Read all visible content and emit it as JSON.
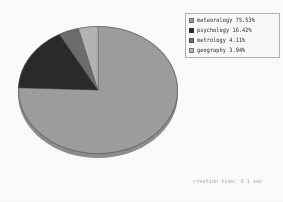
{
  "chart_data": {
    "type": "pie",
    "title": "",
    "subtitle": "",
    "xlabel": "",
    "ylabel": "",
    "grid": false,
    "legend_position": "top-right",
    "three_d": true,
    "start_angle_deg": 0,
    "direction": "clockwise",
    "categories": [
      "meteorology",
      "psychology",
      "metrology",
      "geography"
    ],
    "values": [
      75.53,
      16.42,
      4.11,
      3.94
    ],
    "value_unit": "%",
    "colors": [
      "#9f9f9f",
      "#2b2b2b",
      "#6e6e6e",
      "#b5b5b5"
    ],
    "labels": [
      "meteorology 75.53%",
      "psychology 16.42%",
      "metrology 4.11%",
      "geography 3.94%"
    ]
  },
  "legend": {
    "items": [
      {
        "label": "meteorology 75.53%",
        "color": "#9f9f9f"
      },
      {
        "label": "psychology 16.42%",
        "color": "#2b2b2b"
      },
      {
        "label": "metrology 4.11%",
        "color": "#6e6e6e"
      },
      {
        "label": "geography 3.94%",
        "color": "#b5b5b5"
      }
    ]
  },
  "caption": {
    "text": "creation time: 0.1 sec"
  }
}
